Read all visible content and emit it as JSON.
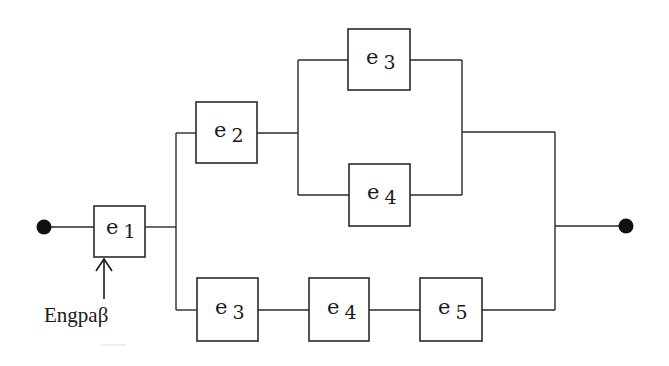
{
  "diagram": {
    "type": "reliability-block-diagram",
    "terminals": {
      "input": {
        "cx": 44,
        "cy": 227
      },
      "output": {
        "cx": 626,
        "cy": 226
      }
    },
    "blocks": [
      {
        "id": "b1",
        "name": "e",
        "sub": "1",
        "x": 94,
        "y": 206,
        "w": 51,
        "h": 51
      },
      {
        "id": "b2",
        "name": "e",
        "sub": "2",
        "x": 196,
        "y": 102,
        "w": 61,
        "h": 61
      },
      {
        "id": "b3",
        "name": "e",
        "sub": "3",
        "x": 348,
        "y": 29,
        "w": 62,
        "h": 61
      },
      {
        "id": "b4",
        "name": "e",
        "sub": "4",
        "x": 349,
        "y": 164,
        "w": 61,
        "h": 62
      },
      {
        "id": "b5",
        "name": "e",
        "sub": "3",
        "x": 197,
        "y": 278,
        "w": 61,
        "h": 63
      },
      {
        "id": "b6",
        "name": "e",
        "sub": "4",
        "x": 309,
        "y": 278,
        "w": 60,
        "h": 63
      },
      {
        "id": "b7",
        "name": "e",
        "sub": "5",
        "x": 420,
        "y": 278,
        "w": 62,
        "h": 63
      }
    ],
    "annotation": {
      "text": "Engpaβ",
      "points_to": "e1"
    }
  }
}
